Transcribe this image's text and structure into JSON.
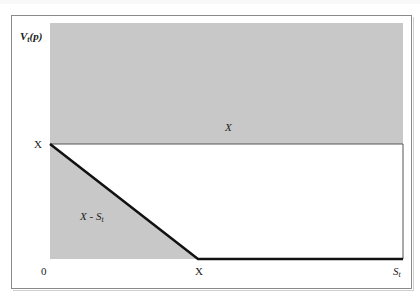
{
  "figure": {
    "y_axis_label": "V",
    "y_axis_label_sub": "t",
    "y_axis_label_arg": "(p)",
    "x_axis_label": "S",
    "x_axis_label_sub": "t",
    "origin_label": "0",
    "y_tick_label": "X",
    "x_tick_label": "X",
    "upper_region_label": "X",
    "lower_region_label": "X - S",
    "lower_region_label_sub": "t"
  },
  "colors": {
    "shaded_region": "#c8c8c8",
    "payoff_line": "#111111",
    "frame": "#8a8a8a",
    "background": "#ffffff"
  },
  "geometry": {
    "upper_band": {
      "x0": 50,
      "y0": 23,
      "x1": 403,
      "y1": 144
    },
    "payoff_polyline": [
      [
        50,
        144
      ],
      [
        198,
        259
      ],
      [
        403,
        259
      ]
    ],
    "axis_x_end": 403,
    "axis_bottom": 259
  }
}
